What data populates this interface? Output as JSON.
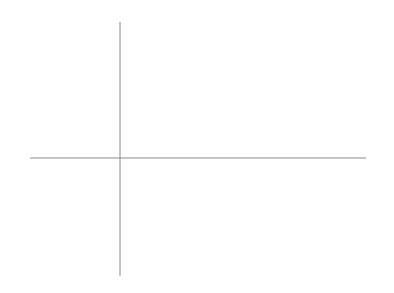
{
  "chart_data": {
    "type": "line",
    "title": "",
    "annotation": "y²=x³−x",
    "xlabel": "x",
    "ylabel": "y",
    "xlim": [
      -1.6,
      4.3
    ],
    "ylim": [
      -5.2,
      5.6
    ],
    "grid": false,
    "x_ticks": [
      "-1.5",
      "-1.0",
      "-0.5",
      "0.5",
      "1.0",
      "1.5",
      "2.0",
      "2.5",
      "3.0",
      "3.5",
      "4.0"
    ],
    "y_ticks": [
      "5",
      "4",
      "3",
      "2",
      "1",
      "-1",
      "-2",
      "-3",
      "-4",
      "-5"
    ],
    "series": [
      {
        "name": "oval component",
        "x_range": [
          -1,
          0
        ],
        "description": "closed loop through (-1,0) and (0,0)"
      },
      {
        "name": "unbounded component",
        "x_range": [
          1,
          3
        ],
        "points": [
          [
            1,
            0
          ],
          [
            1.5,
            1.37
          ],
          [
            2,
            2.45
          ],
          [
            2.5,
            3.62
          ],
          [
            3,
            4.9
          ],
          [
            3,
            -4.9
          ]
        ]
      }
    ]
  },
  "labels": {
    "x_axis": "x",
    "y_axis": "y",
    "equation": "y²=x³−x",
    "x_ticks": [
      "−1.5",
      "−1.0",
      "−0.5",
      "0.5",
      "1.0",
      "1.5",
      "2.0",
      "2.5",
      "3.0",
      "3.5",
      "4.0"
    ],
    "y_ticks": [
      "5",
      "4",
      "3",
      "2",
      "1",
      "−1",
      "−2",
      "−3",
      "−4",
      "−5"
    ]
  }
}
